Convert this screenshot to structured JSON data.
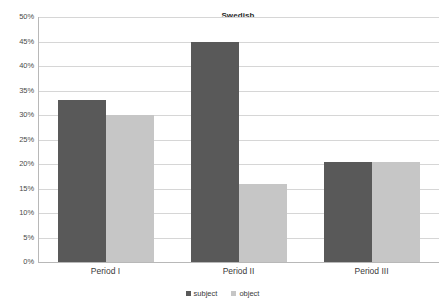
{
  "chart_data": {
    "type": "bar",
    "title": "Swedish",
    "xlabel": "",
    "ylabel": "",
    "categories": [
      "Period I",
      "Period II",
      "Period III"
    ],
    "series": [
      {
        "name": "subject",
        "color": "#595959",
        "values": [
          33,
          45,
          20.5
        ]
      },
      {
        "name": "object",
        "color": "#c6c6c6",
        "values": [
          30,
          16,
          20.5
        ]
      }
    ],
    "ylim": [
      0,
      50
    ],
    "ytick_values": [
      0,
      5,
      10,
      15,
      20,
      25,
      30,
      35,
      40,
      45,
      50
    ],
    "ytick_labels": [
      "0%",
      "5%",
      "10%",
      "15%",
      "20%",
      "25%",
      "30%",
      "35%",
      "40%",
      "45%",
      "50%"
    ],
    "value_suffix": "%",
    "grid": true,
    "grid_axis": "y",
    "legend_position": "bottom",
    "legend": [
      "subject",
      "object"
    ],
    "background_color": "#ffffff",
    "gridline_color": "#d6d6d6",
    "axis_color": "#b8b8b8"
  }
}
